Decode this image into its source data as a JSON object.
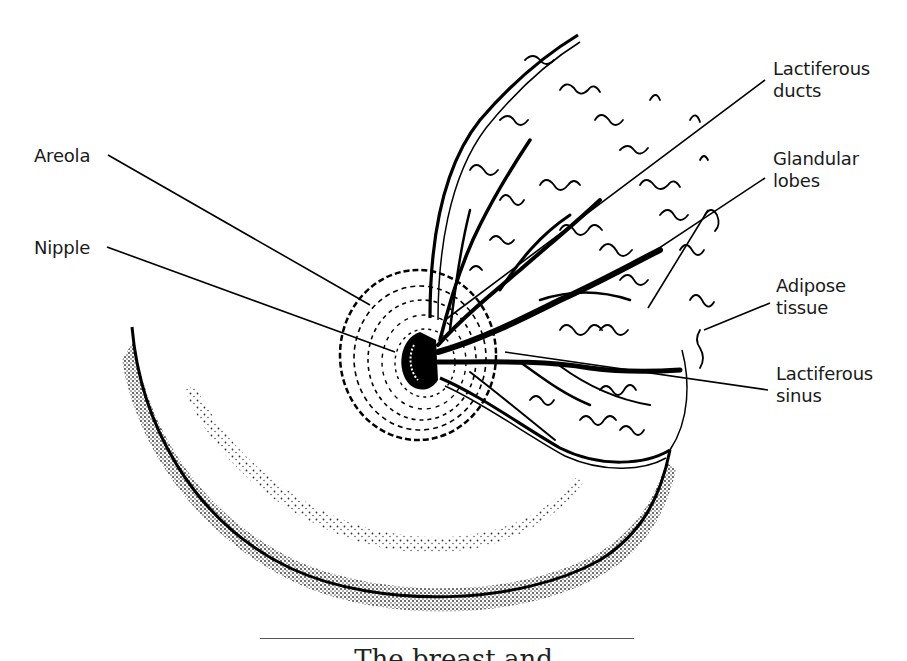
{
  "figure": {
    "type": "anatomical illustration",
    "caption_partial": "The breast and"
  },
  "labels": [
    {
      "id": "areola",
      "lines": [
        "Areola"
      ],
      "x": 34,
      "y": 145,
      "leaders": [
        [
          108,
          155,
          370,
          305
        ]
      ]
    },
    {
      "id": "nipple",
      "lines": [
        "Nipple"
      ],
      "x": 34,
      "y": 237,
      "leaders": [
        [
          107,
          247,
          395,
          352
        ]
      ]
    },
    {
      "id": "lactiferous-ducts",
      "lines": [
        "Lactiferous",
        "ducts"
      ],
      "x": 773,
      "y": 58,
      "leaders": [
        [
          765,
          80,
          445,
          320
        ]
      ]
    },
    {
      "id": "glandular-lobes",
      "lines": [
        "Glandular",
        "lobes"
      ],
      "x": 773,
      "y": 148,
      "leaders": [
        [
          765,
          178,
          638,
          262
        ],
        [
          708,
          210,
          648,
          308
        ]
      ]
    },
    {
      "id": "adipose-tissue",
      "lines": [
        "Adipose",
        "tissue"
      ],
      "x": 776,
      "y": 275,
      "leaders": [
        [
          770,
          303,
          704,
          330
        ]
      ]
    },
    {
      "id": "lactiferous-sinus",
      "lines": [
        "Lactiferous",
        "sinus"
      ],
      "x": 776,
      "y": 363,
      "leaders": [
        [
          768,
          390,
          505,
          352
        ]
      ]
    }
  ],
  "caption_rule": true
}
